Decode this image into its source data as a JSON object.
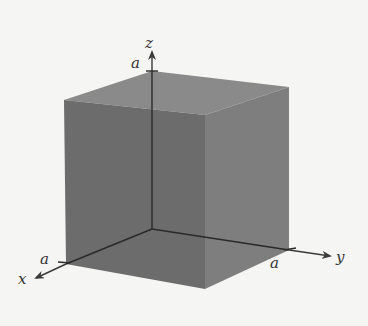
{
  "diagram": {
    "type": "3d-cube-in-first-octant",
    "axes": {
      "x": {
        "label": "x",
        "tick_label": "a"
      },
      "y": {
        "label": "y",
        "tick_label": "a"
      },
      "z": {
        "label": "z",
        "tick_label": "a"
      }
    },
    "colors": {
      "background": "#f5f5f3",
      "front_face": "#6c6c6c",
      "right_face": "#7e7e7e",
      "top_face": "#8a8a8a",
      "back_face": "#5e5e5e",
      "axis": "#2a2a2a"
    }
  }
}
